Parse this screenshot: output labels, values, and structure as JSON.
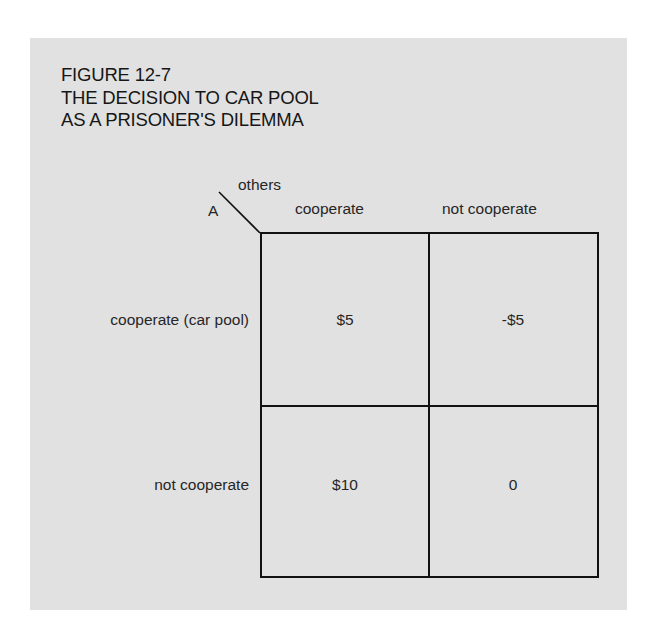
{
  "figure": {
    "number": "FIGURE 12-7",
    "title_line1": "THE DECISION TO CAR POOL",
    "title_line2": "AS A PRISONER'S DILEMMA"
  },
  "matrix": {
    "row_player": "A",
    "column_player": "others",
    "columns": [
      "cooperate",
      "not cooperate"
    ],
    "rows": [
      {
        "label": "cooperate (car pool)",
        "payoffs": [
          "$5",
          "-$5"
        ]
      },
      {
        "label": "not cooperate",
        "payoffs": [
          "$10",
          "0"
        ]
      }
    ]
  },
  "colors": {
    "background": "#e1e1e1",
    "lines": "#111111",
    "text": "#1e1e1e"
  }
}
